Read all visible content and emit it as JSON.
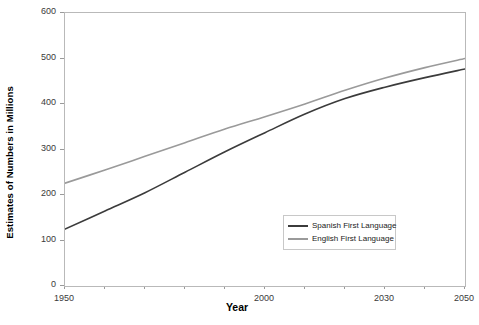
{
  "chart_data": {
    "type": "line",
    "title": "",
    "xlabel": "Year",
    "ylabel": "Estimates of Numbers in Millions",
    "xlim": [
      1950,
      2050
    ],
    "ylim": [
      0,
      600
    ],
    "grid": false,
    "legend_position": "inside-bottom-right",
    "y_ticks": [
      0,
      100,
      200,
      300,
      400,
      500,
      600
    ],
    "y_tick_labels": [
      "0",
      "100",
      "200",
      "300",
      "400",
      "500",
      "600"
    ],
    "x_ticks": [
      1950,
      1960,
      1970,
      1980,
      1990,
      2000,
      2010,
      2020,
      2030,
      2040,
      2050
    ],
    "x_tick_labels_shown": [
      "1950",
      "2000",
      "2030",
      "2050"
    ],
    "x_labeled_ticks": [
      1950,
      2000,
      2030,
      2050
    ],
    "x": [
      1950,
      1960,
      1970,
      1980,
      1990,
      2000,
      2010,
      2020,
      2030,
      2040,
      2050
    ],
    "series": [
      {
        "name": "Spanish First Language",
        "color": "#3b3b3b",
        "values": [
          125,
          165,
          205,
          250,
          295,
          337,
          378,
          412,
          437,
          458,
          477
        ]
      },
      {
        "name": "English First Language",
        "color": "#9a9a9a",
        "values": [
          226,
          255,
          285,
          315,
          345,
          372,
          400,
          430,
          457,
          480,
          500
        ]
      }
    ]
  },
  "legend": {
    "entries": [
      {
        "label": "Spanish First Language"
      },
      {
        "label": "English First Language"
      }
    ]
  },
  "axes": {
    "x_title": "Year",
    "y_title": "Estimates of Numbers in Millions"
  }
}
